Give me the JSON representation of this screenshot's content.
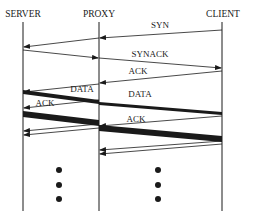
{
  "diagram": {
    "type": "sequence",
    "colors": {
      "line": "#1a1a1a",
      "background": "#ffffff"
    },
    "participants": [
      {
        "id": "server",
        "label": "SERVER"
      },
      {
        "id": "proxy",
        "label": "PROXY"
      },
      {
        "id": "client",
        "label": "CLIENT"
      }
    ],
    "messages": [
      {
        "label": "SYN",
        "from": "client",
        "to": "server",
        "via": "proxy",
        "weight": "thin"
      },
      {
        "label": "SYNACK",
        "from": "server",
        "to": "client",
        "via": "proxy",
        "weight": "thin"
      },
      {
        "label": "ACK",
        "from": "client",
        "to": "proxy",
        "weight": "thin"
      },
      {
        "label": "DATA",
        "from": "server",
        "to": "proxy",
        "weight": "thick"
      },
      {
        "label": "DATA",
        "from": "proxy",
        "to": "client",
        "weight": "thick"
      },
      {
        "label": "ACK",
        "from": "proxy",
        "to": "server",
        "weight": "thin"
      },
      {
        "label": "ACK",
        "from": "client",
        "to": "proxy",
        "weight": "thin"
      }
    ],
    "continuation": "⋮"
  }
}
